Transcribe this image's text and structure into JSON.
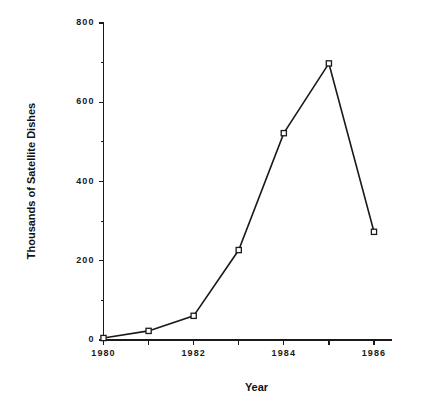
{
  "chart_data": {
    "type": "line",
    "title": "",
    "xlabel": "Year",
    "ylabel": "Thousands of Satellite Dishes",
    "x": [
      1980,
      1981,
      1982,
      1983,
      1984,
      1985,
      1986
    ],
    "values": [
      5,
      23,
      61,
      227,
      522,
      698,
      273
    ],
    "series": [
      {
        "name": "Satellite Dishes",
        "values": [
          5,
          23,
          61,
          227,
          522,
          698,
          273
        ]
      }
    ],
    "xlim": [
      1980,
      1986.4
    ],
    "ylim": [
      0,
      800
    ],
    "y_major_ticks": [
      0,
      200,
      400,
      600,
      800
    ],
    "y_tick_labels": [
      "0",
      "200",
      "400",
      "600",
      "800"
    ],
    "y_minor_ticks": [
      100,
      300,
      500,
      700
    ],
    "x_major_ticks": [
      1980,
      1981,
      1982,
      1983,
      1984,
      1985,
      1986
    ],
    "x_tick_labels": [
      "1980",
      "",
      "1982",
      "",
      "1984",
      "",
      "1986"
    ],
    "grid": false,
    "legend": null,
    "marker": "open-square",
    "line_color": "#1a1a1a",
    "marker_fill": "#ffffff",
    "background": "#ffffff"
  },
  "axes": {
    "y_title": "Thousands of Satellite Dishes",
    "x_title": "Year"
  }
}
